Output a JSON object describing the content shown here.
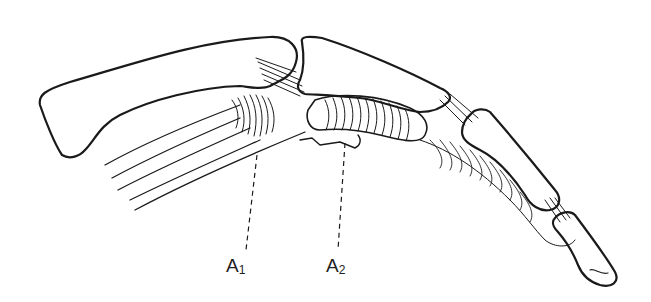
{
  "figure": {
    "labels": [
      {
        "id": "A1",
        "letter": "A",
        "sub": "1",
        "x": 226,
        "y": 258,
        "line_from": [
          257,
          155
        ],
        "line_to": [
          246,
          252
        ]
      },
      {
        "id": "A2",
        "letter": "A",
        "sub": "2",
        "x": 326,
        "y": 258,
        "line_from": [
          345,
          143
        ],
        "line_to": [
          338,
          252
        ]
      }
    ],
    "colors": {
      "ink": "#1a1a1a",
      "background": "#ffffff"
    }
  }
}
